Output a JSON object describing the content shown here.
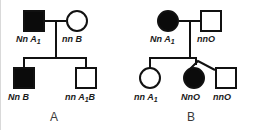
{
  "figure": {
    "type": "pedigree-chart-pair",
    "background": "#ffffff",
    "stroke_color": "#111111",
    "filled_color": "#0b0b0b",
    "open_color": "#ffffff"
  },
  "panels": [
    {
      "caption": "A",
      "generations": [
        {
          "name": "parents",
          "individuals": [
            {
              "shape": "square",
              "sex": "male",
              "affected": true,
              "genotype_label": "Nn A",
              "subscript": "1"
            },
            {
              "shape": "circle",
              "sex": "female",
              "affected": false,
              "genotype_label": "nn B",
              "subscript": ""
            }
          ]
        },
        {
          "name": "children",
          "individuals": [
            {
              "shape": "square",
              "sex": "male",
              "affected": true,
              "genotype_label": "Nn B",
              "subscript": ""
            },
            {
              "shape": "square",
              "sex": "male",
              "affected": false,
              "genotype_label": "nn A",
              "subscript": "1",
              "genotype_suffix": "B"
            }
          ]
        }
      ]
    },
    {
      "caption": "B",
      "generations": [
        {
          "name": "parents",
          "individuals": [
            {
              "shape": "circle",
              "sex": "female",
              "affected": true,
              "genotype_label": "Nn A",
              "subscript": "1"
            },
            {
              "shape": "square",
              "sex": "male",
              "affected": false,
              "genotype_label": "nnO",
              "subscript": ""
            }
          ]
        },
        {
          "name": "children",
          "individuals": [
            {
              "shape": "circle",
              "sex": "female",
              "affected": false,
              "genotype_label": "nn A",
              "subscript": "1"
            },
            {
              "shape": "circle",
              "sex": "female",
              "affected": true,
              "genotype_label": "NnO",
              "subscript": ""
            },
            {
              "shape": "square",
              "sex": "male",
              "affected": false,
              "genotype_label": "nnO",
              "subscript": ""
            }
          ]
        }
      ]
    }
  ],
  "labels": {
    "a_parent_left": "Nn A",
    "a_parent_left_sub": "1",
    "a_parent_right": "nn B",
    "a_child_left": "Nn B",
    "a_child_right_pre": "nn A",
    "a_child_right_sub": "1",
    "a_child_right_post": "B",
    "a_caption": "A",
    "b_parent_left": "Nn A",
    "b_parent_left_sub": "1",
    "b_parent_right": "nnO",
    "b_child_left_pre": "nn A",
    "b_child_left_sub": "1",
    "b_child_mid": "NnO",
    "b_child_right": "nnO",
    "b_caption": "B"
  }
}
